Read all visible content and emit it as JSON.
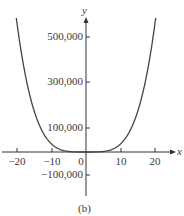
{
  "chart_data": {
    "type": "line",
    "title": "",
    "caption": "(b)",
    "xlabel": "x",
    "ylabel": "y",
    "xlim": [
      -22,
      23
    ],
    "ylim": [
      -180000,
      580000
    ],
    "grid": false,
    "x_ticks": [
      -20,
      -10,
      0,
      10,
      20
    ],
    "x_tick_labels": [
      "−20",
      "−10",
      "0",
      "10",
      "20"
    ],
    "y_ticks": [
      500000,
      300000,
      100000,
      -100000
    ],
    "y_tick_labels": [
      "500,000",
      "300,000",
      "100,000",
      "−100,000"
    ],
    "series": [
      {
        "name": "curve",
        "x": [
          -20,
          -17.5,
          -15,
          -12.5,
          -10,
          -7.5,
          -5,
          -2.5,
          0,
          2.5,
          5,
          7.5,
          10,
          12.5,
          15,
          17.5,
          20
        ],
        "y": [
          560000,
          328000,
          177000,
          85000,
          35000,
          11000,
          2200,
          140,
          0,
          140,
          2200,
          11000,
          35000,
          85000,
          177000,
          328000,
          560000
        ]
      }
    ]
  },
  "labels": {
    "x_axis": "x",
    "y_axis": "y",
    "caption": "(b)",
    "y_ticks": [
      "500,000",
      "300,000",
      "100,000",
      "−100,000"
    ],
    "x_ticks": [
      "−20",
      "−10",
      "0",
      "10",
      "20"
    ]
  }
}
